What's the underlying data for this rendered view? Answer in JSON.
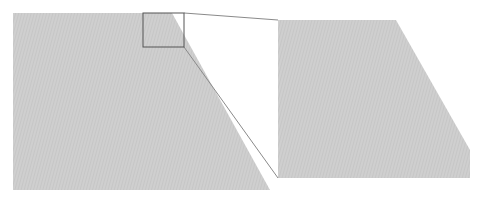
{
  "diagram": {
    "type": "zoom-inset",
    "colors": {
      "fill": "#cfcfcf",
      "hatch": "#bdbdbd",
      "inset_stroke": "#555555",
      "connector": "#8a8a8a",
      "background": "#ffffff"
    },
    "source_shape": {
      "points": "13,13 172,13 270,190 13,190"
    },
    "inset_box": {
      "x": 143,
      "y": 13,
      "width": 41,
      "height": 34
    },
    "magnified_shape": {
      "points": "278,20 396,20 470,150 470,178 278,178"
    },
    "connectors": [
      {
        "x1": 184,
        "y1": 13,
        "x2": 278,
        "y2": 20
      },
      {
        "x1": 184,
        "y1": 47,
        "x2": 278,
        "y2": 178
      }
    ]
  }
}
